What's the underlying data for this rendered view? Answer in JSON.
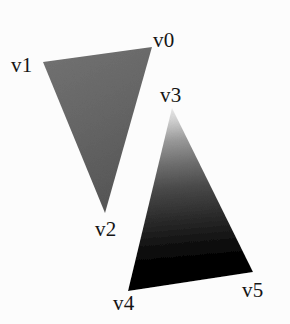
{
  "scene": {
    "background_color": "#fcfcfc",
    "width": 290,
    "height": 324,
    "label_color": "#151515"
  },
  "labels": {
    "v0": "v0",
    "v1": "v1",
    "v2": "v2",
    "v3": "v3",
    "v4": "v4",
    "v5": "v5"
  },
  "triangles": [
    {
      "name": "left-triangle",
      "vertex_names": [
        "v0",
        "v1",
        "v2"
      ],
      "points": "152,47 43,62 105,213",
      "shading": "flat-gray",
      "fill_colors": [
        "#6e6e6e",
        "#5e5e5e"
      ],
      "gradient_from": "#6f6f6f",
      "gradient_to": "#5a5a5a"
    },
    {
      "name": "right-triangle",
      "vertex_names": [
        "v3",
        "v4",
        "v5"
      ],
      "points": "172,108 128,291 253,272",
      "shading": "vertical-gradient",
      "fill_colors": [
        "#ededed",
        "#000000",
        "#000000"
      ],
      "gradient_from": "#ededed",
      "gradient_to": "#000000"
    }
  ],
  "vertex_positions": {
    "v0": "152,47",
    "v1": "43,62",
    "v2": "105,213",
    "v3": "172,108",
    "v4": "128,291",
    "v5": "253,272"
  }
}
